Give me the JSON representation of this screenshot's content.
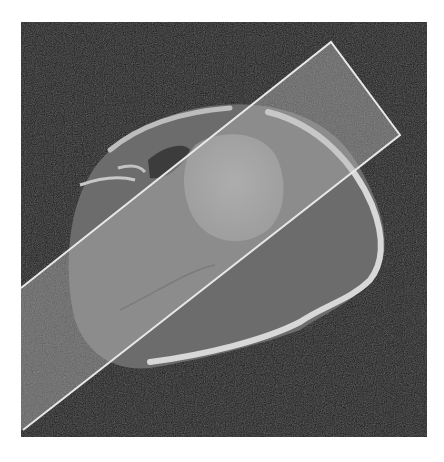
{
  "image": {
    "subject": "axial CT slice of shoulder with humeral head",
    "modality": "CT",
    "background_color": "#ffffff",
    "scan_background_color": "#141414",
    "frame": {
      "x": 21,
      "y": 22,
      "width": 406,
      "height": 415
    }
  },
  "overlay": {
    "shape": "rotated-rectangle",
    "fill_color": "#b4b4b4",
    "fill_opacity": 0.45,
    "stroke_color": "#e8e8e8",
    "corners": [
      [
        21,
        288
      ],
      [
        331,
        42
      ],
      [
        400,
        135
      ],
      [
        23,
        430
      ]
    ]
  },
  "colors": {
    "soft_tissue": "#6a6a6a",
    "bone_cortex": "#dcdcdc",
    "humeral_head": "#9e9e9e",
    "fat": "#3a3a3a"
  }
}
